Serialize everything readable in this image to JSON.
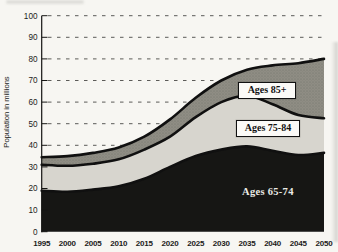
{
  "figure": {
    "kind": "stacked area chart, scanned print figure",
    "background": "#f7f6f2"
  },
  "chart_data": {
    "type": "area",
    "stacked": true,
    "title": "",
    "xlabel": "",
    "ylabel": "Population in millions",
    "x": [
      "1995",
      "2000",
      "2005",
      "2010",
      "2015",
      "2020",
      "2025",
      "2030",
      "2035",
      "2040",
      "2045",
      "2050"
    ],
    "series": [
      {
        "name": "Ages 65-74",
        "color": "#161614",
        "label_style": "white text on area",
        "values": [
          19.0,
          18.5,
          19.5,
          21.0,
          24.5,
          30.0,
          35.0,
          38.0,
          39.5,
          37.5,
          35.5,
          36.5
        ]
      },
      {
        "name": "Ages 75-84",
        "color": "#d7d5ce",
        "label_style": "boxed label on area",
        "values": [
          12.0,
          12.0,
          12.0,
          12.5,
          13.5,
          14.0,
          18.0,
          22.0,
          23.5,
          21.5,
          18.5,
          16.0
        ]
      },
      {
        "name": "Ages 85+",
        "color": "#8f8d84",
        "texture": "stipple",
        "label_style": "boxed label on area",
        "values": [
          3.5,
          4.5,
          5.0,
          5.5,
          6.0,
          8.0,
          9.0,
          10.0,
          12.0,
          18.0,
          24.0,
          27.5
        ]
      }
    ],
    "cumulative_totals": [
      34.5,
      35.0,
      36.5,
      39.0,
      44.0,
      52.0,
      62.0,
      70.0,
      75.0,
      77.0,
      78.0,
      80.0
    ],
    "ylim": [
      0,
      100
    ],
    "ytick_step": 10,
    "grid": "horizontal dashed lines at every 10, drawn behind areas",
    "legend": "inline area labels",
    "edge_line_color": "#101010",
    "axis_text_color": "#1c1c1a"
  }
}
